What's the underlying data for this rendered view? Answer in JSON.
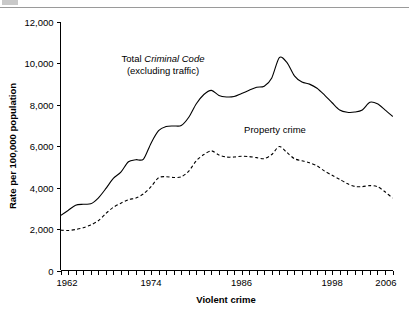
{
  "chart_data": {
    "type": "line",
    "title": "",
    "xlabel": "Violent crime",
    "ylabel": "Rate per 100,000 population",
    "xlim": [
      1962,
      2006
    ],
    "ylim": [
      0,
      12000
    ],
    "grid": false,
    "legend_position": "inline-annotations",
    "x_tick_labels": [
      "1962",
      "1974",
      "1986",
      "1998",
      "2006"
    ],
    "x_tick_values": [
      1962,
      1974,
      1986,
      1998,
      2006
    ],
    "x_minor_tick_interval": 1,
    "y_tick_labels": [
      "0",
      "2,000",
      "4,000",
      "6,000",
      "8,000",
      "10,000",
      "12,000"
    ],
    "y_tick_values": [
      0,
      2000,
      4000,
      6000,
      8000,
      10000,
      12000
    ],
    "annotations": [
      {
        "name": "total-criminal-code-label",
        "line1_prefix": "Total ",
        "line1_italic": "Criminal Code",
        "line2": "(excluding traffic)",
        "x": 163,
        "y": 62
      },
      {
        "name": "property-crime-label",
        "text": "Property crime",
        "x": 275,
        "y": 133
      }
    ],
    "x": [
      1962,
      1963,
      1964,
      1965,
      1966,
      1967,
      1968,
      1969,
      1970,
      1971,
      1972,
      1973,
      1974,
      1975,
      1976,
      1977,
      1978,
      1979,
      1980,
      1981,
      1982,
      1983,
      1984,
      1985,
      1986,
      1987,
      1988,
      1989,
      1990,
      1991,
      1992,
      1993,
      1994,
      1995,
      1996,
      1997,
      1998,
      1999,
      2000,
      2001,
      2002,
      2003,
      2004,
      2005,
      2006
    ],
    "series": [
      {
        "name": "Total Criminal Code (excluding traffic)",
        "style": "solid",
        "values": [
          2650,
          2900,
          3150,
          3200,
          3220,
          3500,
          3950,
          4450,
          4750,
          5250,
          5350,
          5380,
          6150,
          6750,
          6950,
          6980,
          7000,
          7400,
          8050,
          8500,
          8700,
          8450,
          8380,
          8400,
          8550,
          8700,
          8850,
          8900,
          9300,
          10280,
          10050,
          9400,
          9100,
          9000,
          8800,
          8470,
          8100,
          7750,
          7640,
          7650,
          7750,
          8120,
          8050,
          7760,
          7450
        ]
      },
      {
        "name": "Property crime",
        "style": "dashed",
        "values": [
          1950,
          1930,
          1980,
          2060,
          2200,
          2400,
          2750,
          3050,
          3250,
          3420,
          3500,
          3700,
          4050,
          4480,
          4530,
          4490,
          4520,
          4800,
          5300,
          5600,
          5780,
          5580,
          5480,
          5480,
          5520,
          5500,
          5450,
          5400,
          5600,
          5990,
          5700,
          5400,
          5300,
          5200,
          5050,
          4800,
          4600,
          4400,
          4200,
          4060,
          4050,
          4100,
          4050,
          3800,
          3500
        ]
      }
    ]
  }
}
